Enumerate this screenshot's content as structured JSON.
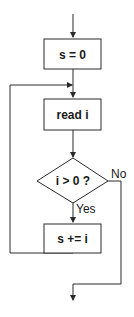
{
  "diagram": {
    "type": "flowchart",
    "nodes": [
      {
        "id": "init",
        "shape": "rectangle",
        "label": "s = 0"
      },
      {
        "id": "read",
        "shape": "rectangle",
        "label": "read i"
      },
      {
        "id": "cond",
        "shape": "diamond",
        "label": "i > 0 ?"
      },
      {
        "id": "accum",
        "shape": "rectangle",
        "label": "s += i"
      }
    ],
    "edges": [
      {
        "from": "start",
        "to": "init",
        "label": ""
      },
      {
        "from": "init",
        "to": "read",
        "label": ""
      },
      {
        "from": "read",
        "to": "cond",
        "label": ""
      },
      {
        "from": "cond",
        "to": "accum",
        "label": "Yes"
      },
      {
        "from": "cond",
        "to": "exit",
        "label": "No"
      },
      {
        "from": "accum",
        "to": "read",
        "label": ""
      }
    ],
    "colors": {
      "stroke": "#2a2a2a",
      "background": "#ffffff",
      "text": "#1a1a1a"
    }
  }
}
